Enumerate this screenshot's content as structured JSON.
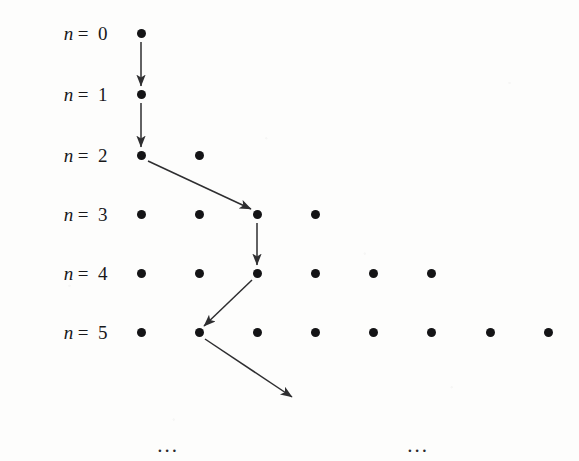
{
  "figure": {
    "background_color": "#fdfdfc",
    "dot_color": "#141416",
    "arrow_color": "#2e2e30",
    "label_color": "#18181a"
  },
  "rows": [
    {
      "label_var": "n",
      "label_eq": "=",
      "label_val": "0",
      "y": 33,
      "dot_count": 1,
      "dots_x": [
        141
      ]
    },
    {
      "label_var": "n",
      "label_eq": "=",
      "label_val": "1",
      "y": 94,
      "dot_count": 1,
      "dots_x": [
        141
      ]
    },
    {
      "label_var": "n",
      "label_eq": "=",
      "label_val": "2",
      "y": 155,
      "dot_count": 2,
      "dots_x": [
        141,
        199
      ]
    },
    {
      "label_var": "n",
      "label_eq": "=",
      "label_val": "3",
      "y": 214,
      "dot_count": 4,
      "dots_x": [
        141,
        199,
        257,
        315
      ]
    },
    {
      "label_var": "n",
      "label_eq": "=",
      "label_val": "4",
      "y": 273,
      "dot_count": 6,
      "dots_x": [
        141,
        199,
        257,
        315,
        373,
        431
      ]
    },
    {
      "label_var": "n",
      "label_eq": "=",
      "label_val": "5",
      "y": 332,
      "dot_count": 8,
      "dots_x": [
        141,
        199,
        257,
        315,
        373,
        431,
        490,
        548
      ]
    }
  ],
  "label_right_edge_x": 108,
  "arrows": [
    {
      "name": "arrow-n0-to-n1",
      "x1": 141,
      "y1": 42,
      "x2": 141,
      "y2": 86
    },
    {
      "name": "arrow-n1-to-n2",
      "x1": 141,
      "y1": 103,
      "x2": 141,
      "y2": 147
    },
    {
      "name": "arrow-n2-to-n3",
      "x1": 148,
      "y1": 161,
      "x2": 251,
      "y2": 209
    },
    {
      "name": "arrow-n3-to-n4",
      "x1": 257,
      "y1": 223,
      "x2": 257,
      "y2": 265
    },
    {
      "name": "arrow-n4-to-n5",
      "x1": 252,
      "y1": 280,
      "x2": 204,
      "y2": 326
    },
    {
      "name": "arrow-n5-continuing",
      "x1": 205,
      "y1": 339,
      "x2": 292,
      "y2": 397
    }
  ],
  "ellipses": [
    {
      "name": "ellipsis-left",
      "text": "...",
      "x": 168,
      "y": 445
    },
    {
      "name": "ellipsis-right",
      "text": "...",
      "x": 418,
      "y": 445
    }
  ],
  "chart_data": {
    "type": "scatter",
    "xlabel": "",
    "ylabel": "n",
    "grid": false,
    "legend": "none",
    "categories": [
      "n = 0",
      "n = 1",
      "n = 2",
      "n = 3",
      "n = 4",
      "n = 5"
    ],
    "values": [
      1,
      1,
      2,
      4,
      6,
      8
    ],
    "series": [
      {
        "name": "dots per row",
        "values": [
          1,
          1,
          2,
          4,
          6,
          8
        ]
      }
    ],
    "points": [
      {
        "row": 0,
        "x_positions": [
          141
        ]
      },
      {
        "row": 1,
        "x_positions": [
          141
        ]
      },
      {
        "row": 2,
        "x_positions": [
          141,
          199
        ]
      },
      {
        "row": 3,
        "x_positions": [
          141,
          199,
          257,
          315
        ]
      },
      {
        "row": 4,
        "x_positions": [
          141,
          199,
          257,
          315,
          373,
          431
        ]
      },
      {
        "row": 5,
        "x_positions": [
          141,
          199,
          257,
          315,
          373,
          431,
          490,
          548
        ]
      }
    ],
    "path": [
      {
        "row": 0,
        "column": 0
      },
      {
        "row": 1,
        "column": 0
      },
      {
        "row": 2,
        "column": 0
      },
      {
        "row": 3,
        "column": 2
      },
      {
        "row": 4,
        "column": 2
      },
      {
        "row": 5,
        "column": 1
      }
    ],
    "annotations": [
      "...",
      "..."
    ]
  }
}
